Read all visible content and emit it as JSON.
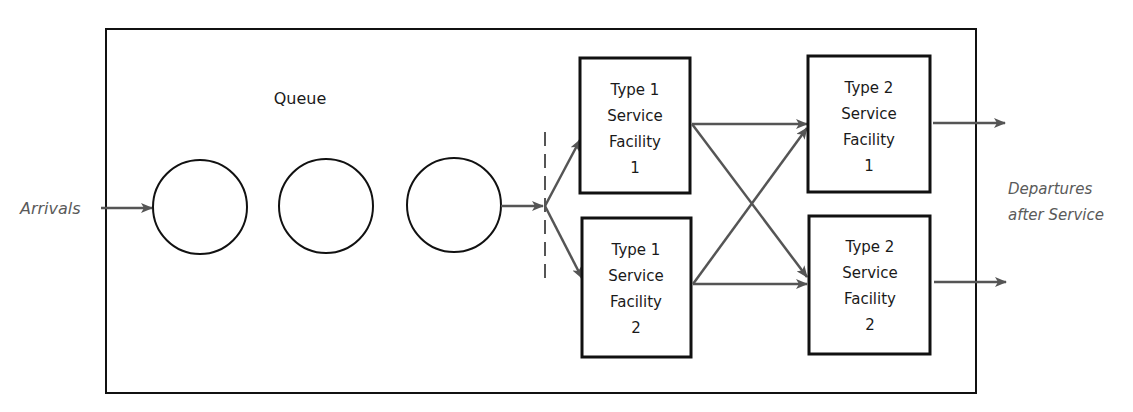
{
  "diagram": {
    "queue_label": "Queue",
    "arrivals_label": "Arrivals",
    "departures_label_line1": "Departures",
    "departures_label_line2": "after Service",
    "queue_circles": 3,
    "type1_facilities": [
      {
        "line1": "Type 1",
        "line2": "Service",
        "line3": "Facility",
        "line4": "1"
      },
      {
        "line1": "Type 1",
        "line2": "Service",
        "line3": "Facility",
        "line4": "2"
      }
    ],
    "type2_facilities": [
      {
        "line1": "Type 2",
        "line2": "Service",
        "line3": "Facility",
        "line4": "1"
      },
      {
        "line1": "Type 2",
        "line2": "Service",
        "line3": "Facility",
        "line4": "2"
      }
    ],
    "colors": {
      "outline": "#111111",
      "arrow": "#555555",
      "label_italic": "#5a5a5a"
    }
  }
}
